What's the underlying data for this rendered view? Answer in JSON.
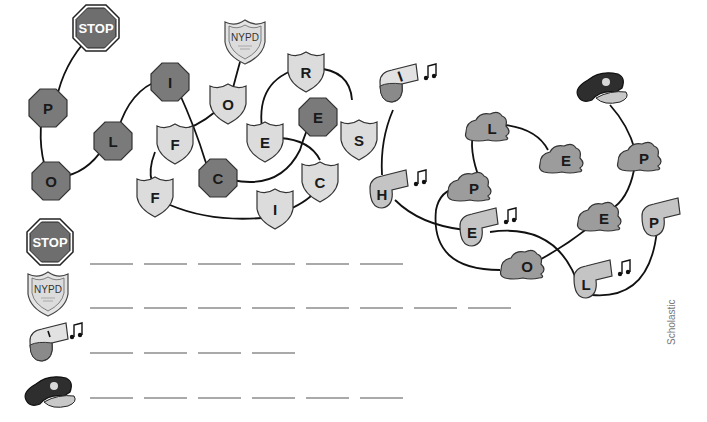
{
  "puzzle": {
    "colors": {
      "octagon": "#7a7a7a",
      "badge": "#dcdcdc",
      "whistle": "#c4c4c4",
      "cap_patch": "#9c9c9c",
      "cap": "#2e2e2e",
      "line": "#111111"
    },
    "stop_sign_label": "STOP",
    "nypd_label": "NYPD",
    "octagon_letters": [
      "P",
      "O",
      "L",
      "I",
      "C",
      "E"
    ],
    "badge_letters": [
      "O",
      "F",
      "F",
      "I",
      "C",
      "E",
      "R",
      "S"
    ],
    "whistle_letters": [
      "I",
      "H",
      "E",
      "L",
      "P"
    ],
    "cap_letters": [
      "P",
      "E",
      "O",
      "P",
      "L",
      "E"
    ]
  },
  "answer_rows": [
    {
      "icon": "stop-sign",
      "label": "STOP",
      "blanks": 6
    },
    {
      "icon": "nypd-badge",
      "label": "NYPD",
      "blanks": 8
    },
    {
      "icon": "whistle",
      "label": "",
      "blanks": 4
    },
    {
      "icon": "police-cap",
      "label": "",
      "blanks": 6
    }
  ],
  "credit": "Scholastic"
}
